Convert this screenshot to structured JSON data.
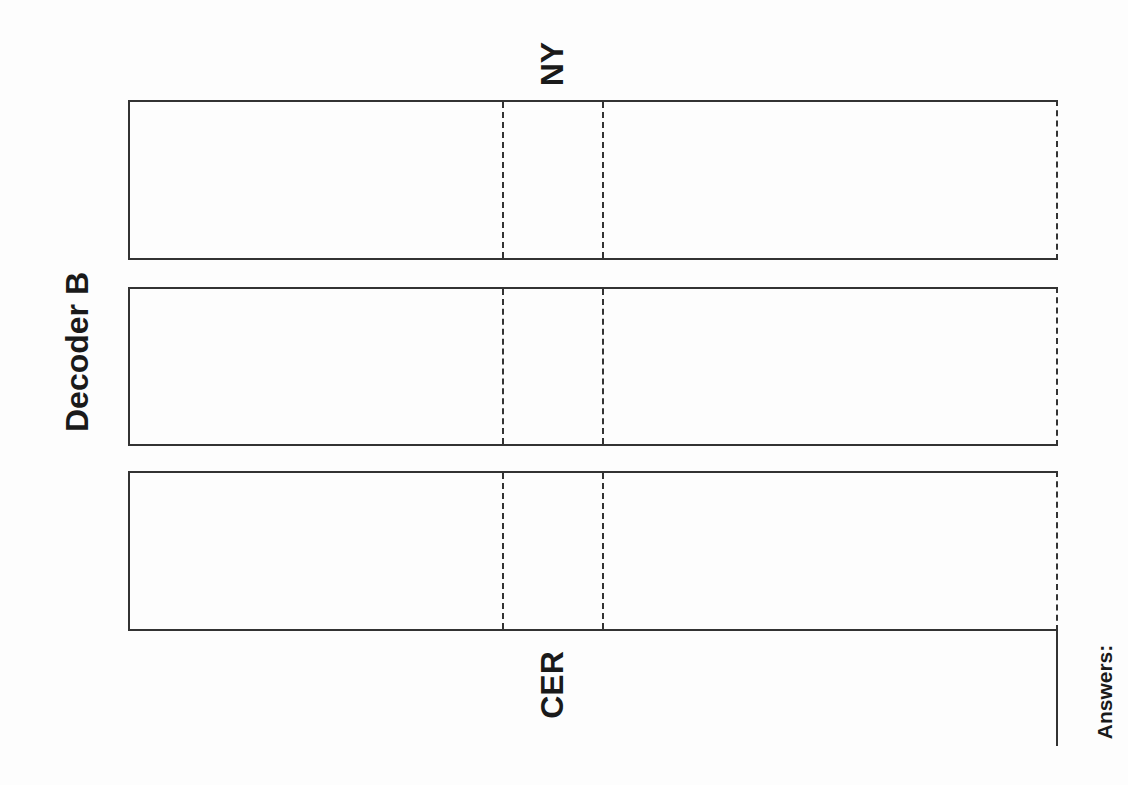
{
  "worksheet": {
    "title": "Decoder B",
    "top_label": "NY",
    "bottom_label": "CER",
    "answers_label": "Answers:",
    "strips": [
      {
        "id": 1,
        "content": ""
      },
      {
        "id": 2,
        "content": ""
      },
      {
        "id": 3,
        "content": ""
      }
    ],
    "line_color": "#333333",
    "background_color": "#fdfdfd"
  }
}
